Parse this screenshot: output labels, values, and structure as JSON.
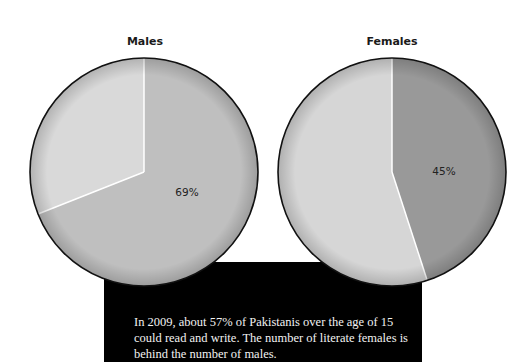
{
  "chart_data": [
    {
      "type": "pie",
      "title": "Males",
      "slices": [
        {
          "label": "Literate",
          "value": 69,
          "color": "#bfbfbf",
          "label_text": "69%"
        },
        {
          "label": "Not literate",
          "value": 31,
          "color": "#d9d9d9"
        }
      ]
    },
    {
      "type": "pie",
      "title": "Females",
      "slices": [
        {
          "label": "Literate",
          "value": 45,
          "color": "#999999",
          "label_text": "45%"
        },
        {
          "label": "Not literate",
          "value": 55,
          "color": "#d6d6d6"
        }
      ]
    }
  ],
  "males": {
    "title": "Males",
    "label": "69%"
  },
  "females": {
    "title": "Females",
    "label": "45%"
  },
  "caption": "In 2009, about 57% of Pakistanis over the age of 15 could read and write. The number of literate females is behind the number of males."
}
